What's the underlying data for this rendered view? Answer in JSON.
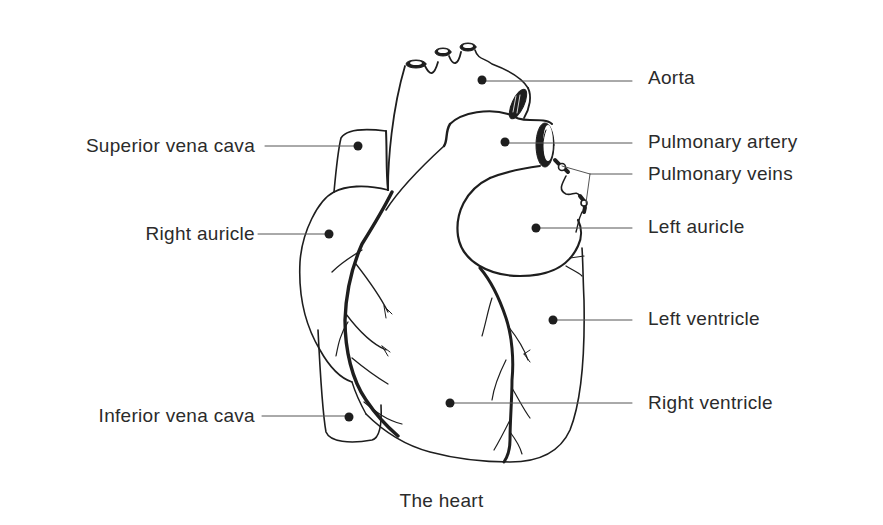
{
  "diagram": {
    "caption": "The heart",
    "colors": {
      "ink": "#1e1e1e",
      "text": "#2b2b2b",
      "background": "#ffffff"
    },
    "labels": {
      "aorta": "Aorta",
      "pulmonary_artery": "Pulmonary artery",
      "pulmonary_veins": "Pulmonary veins",
      "left_auricle": "Left auricle",
      "left_ventricle": "Left ventricle",
      "right_ventricle": "Right ventricle",
      "superior_vena_cava": "Superior vena cava",
      "right_auricle": "Right auricle",
      "inferior_vena_cava": "Inferior vena cava"
    }
  }
}
